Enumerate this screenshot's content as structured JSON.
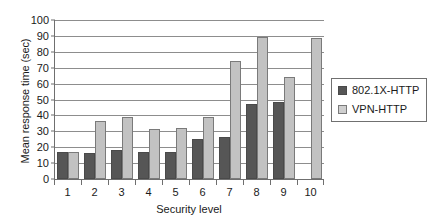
{
  "chart_data": {
    "type": "bar",
    "title": "",
    "xlabel": "Security level",
    "ylabel": "Mean response time (sec)",
    "categories": [
      "1",
      "2",
      "3",
      "4",
      "5",
      "6",
      "7",
      "8",
      "9",
      "10"
    ],
    "series": [
      {
        "name": "802.1X-HTTP",
        "color": "#565656",
        "values": [
          17,
          16,
          18,
          17,
          17,
          25,
          26,
          47,
          48,
          null
        ]
      },
      {
        "name": "VPN-HTTP",
        "color": "#c2c2c2",
        "values": [
          17,
          36,
          39,
          31,
          32,
          39,
          74,
          89,
          64,
          88
        ]
      }
    ],
    "ylim": [
      0,
      100
    ],
    "y_ticks": [
      0,
      10,
      20,
      30,
      40,
      50,
      60,
      70,
      80,
      90,
      100
    ],
    "grid": true,
    "legend_position": "right"
  },
  "legend": {
    "entries": [
      {
        "label": "802.1X-HTTP"
      },
      {
        "label": "VPN-HTTP"
      }
    ]
  }
}
